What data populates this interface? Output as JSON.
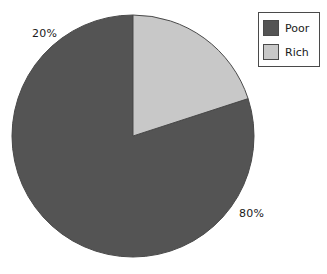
{
  "chart_data": {
    "type": "pie",
    "title": "",
    "categories": [
      "Poor",
      "Rich"
    ],
    "values": [
      80,
      20
    ],
    "value_labels": [
      "80%",
      "20%"
    ],
    "colors": [
      "#545454",
      "#c8c8c8"
    ],
    "edge_color": "#4a4a4a",
    "start_angle_deg": 90,
    "direction": "counterclockwise",
    "legend": {
      "position": "upper-right",
      "border_color": "#4a4a4a",
      "background": "#ffffff",
      "entries": [
        {
          "label": "Poor",
          "color": "#545454"
        },
        {
          "label": "Rich",
          "color": "#c8c8c8"
        }
      ]
    },
    "labels_outside": true,
    "grid": false,
    "background": "#ffffff"
  },
  "geometry": {
    "center_x": 133,
    "center_y": 136,
    "radius": 121
  }
}
